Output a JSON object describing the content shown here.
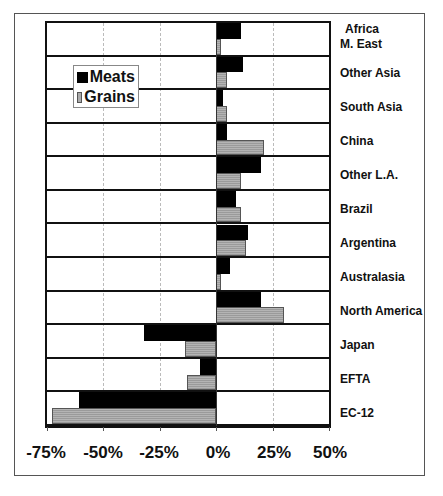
{
  "chart_data": {
    "type": "bar",
    "orientation": "horizontal",
    "title": "",
    "xlabel": "",
    "ylabel": "",
    "xlim": [
      -75,
      50
    ],
    "x_ticks": [
      "-75%",
      "-50%",
      "-25%",
      "0%",
      "25%",
      "50%"
    ],
    "x_tick_values": [
      -75,
      -50,
      -25,
      0,
      25,
      50
    ],
    "grid": true,
    "legend_position": "upper-left inside plot",
    "categories": [
      "Africa M. East",
      "Other Asia",
      "South Asia",
      "China",
      "Other L.A.",
      "Brazil",
      "Argentina",
      "Australasia",
      "North America",
      "Japan",
      "EFTA",
      "EC-12"
    ],
    "category_display": [
      [
        "Africa",
        "M. East"
      ],
      [
        "Other Asia"
      ],
      [
        "South Asia"
      ],
      [
        "China"
      ],
      [
        "Other L.A."
      ],
      [
        "Brazil"
      ],
      [
        "Argentina"
      ],
      [
        "Australasia"
      ],
      [
        "North America"
      ],
      [
        "Japan"
      ],
      [
        "EFTA"
      ],
      [
        "EC-12"
      ]
    ],
    "series": [
      {
        "name": "Meats",
        "color": "#000000",
        "values": [
          11,
          12,
          3,
          5,
          20,
          9,
          14,
          6,
          20,
          -32,
          -7,
          -61
        ]
      },
      {
        "name": "Grains",
        "color": "#a8a8a8",
        "values": [
          2,
          5,
          5,
          21,
          11,
          11,
          13,
          2,
          30,
          -14,
          -13,
          -73
        ]
      }
    ]
  },
  "legend": {
    "items": [
      {
        "label": "Meats"
      },
      {
        "label": "Grains"
      }
    ]
  },
  "axis": {
    "ticks": [
      "-75%",
      "-50%",
      "-25%",
      "0%",
      "25%",
      "50%"
    ]
  },
  "labels": {
    "c0a": "Africa",
    "c0b": "M. East",
    "c1": "Other Asia",
    "c2": "South Asia",
    "c3": "China",
    "c4": "Other L.A.",
    "c5": "Brazil",
    "c6": "Argentina",
    "c7": "Australasia",
    "c8": "North America",
    "c9": "Japan",
    "c10": "EFTA",
    "c11": "EC-12"
  }
}
